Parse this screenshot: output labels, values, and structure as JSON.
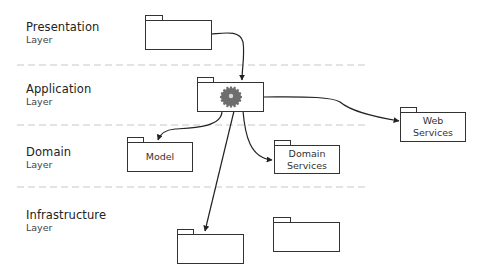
{
  "layers": [
    {
      "name": "Presentation",
      "sub": "Layer"
    },
    {
      "name": "Application",
      "sub": "Layer"
    },
    {
      "name": "Domain",
      "sub": "Layer"
    },
    {
      "name": "Infrastructure",
      "sub": "Layer"
    }
  ],
  "packages": {
    "presentation": {
      "label": ""
    },
    "application": {
      "label": "",
      "icon": "gear-icon"
    },
    "model": {
      "label": "Model"
    },
    "domain_services": {
      "line1": "Domain",
      "line2": "Services"
    },
    "web_services": {
      "line1": "Web",
      "line2": "Services"
    },
    "infra_1": {
      "label": ""
    },
    "infra_2": {
      "label": ""
    }
  },
  "colors": {
    "line": "#333333",
    "divider": "#c8c8c8",
    "gear": "#6e6e6e"
  }
}
